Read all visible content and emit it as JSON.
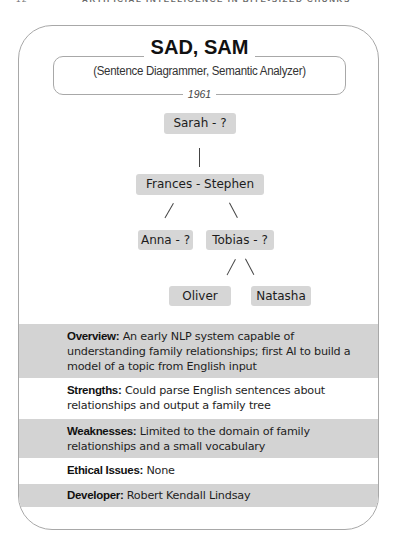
{
  "running_header": {
    "page_number": "12",
    "title": "ARTIFICIAL INTELLIGENCE IN BITE-SIZED CHUNKS"
  },
  "card": {
    "title": "SAD, SAM",
    "subtitle": "(Sentence Diagrammer, Semantic Analyzer)",
    "year": "1961"
  },
  "family_tree": {
    "nodes": {
      "sarah": "Sarah - ?",
      "frances_stephen": "Frances - Stephen",
      "anna": "Anna - ?",
      "tobias": "Tobias - ?",
      "oliver": "Oliver",
      "natasha": "Natasha"
    },
    "edges": [
      [
        "Sarah - ?",
        "Frances - Stephen"
      ],
      [
        "Frances - Stephen",
        "Anna - ?"
      ],
      [
        "Frances - Stephen",
        "Tobias - ?"
      ],
      [
        "Tobias - ?",
        "Oliver"
      ],
      [
        "Tobias - ?",
        "Natasha"
      ]
    ]
  },
  "info": {
    "overview": {
      "label": "Overview:",
      "text": "An early NLP system capable of understanding family relationships; first AI to build a model of a topic from English input"
    },
    "strengths": {
      "label": "Strengths:",
      "text": "Could parse English sentences about relationships and output a family tree"
    },
    "weaknesses": {
      "label": "Weaknesses:",
      "text": "Limited to the domain of family relationships and a small vocabulary"
    },
    "ethical_issues": {
      "label": "Ethical Issues:",
      "text": "None"
    },
    "developer": {
      "label": "Developer:",
      "text": "Robert Kendall Lindsay"
    }
  },
  "colors": {
    "node_fill": "#d6d6d6",
    "band_gray": "#d3d3d3",
    "border": "#a8a8a8"
  }
}
